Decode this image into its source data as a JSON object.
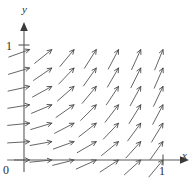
{
  "figure": {
    "axes": {
      "x_axis_label": "x",
      "y_axis_label": "y",
      "origin_label": "0",
      "x_tick_label": "1",
      "y_tick_label": "1"
    }
  },
  "chart_data": {
    "type": "scatter",
    "plot_kind": "direction-field",
    "title": "",
    "subtitle": "",
    "xlabel": "x",
    "ylabel": "y",
    "xlim": [
      0,
      1.18
    ],
    "ylim": [
      0,
      1.12
    ],
    "xticks": [
      0,
      1
    ],
    "xticklabels": [
      "0",
      "1"
    ],
    "yticks": [
      0,
      1
    ],
    "yticklabels": [
      "0",
      "1"
    ],
    "grid": false,
    "legend": null,
    "annotations": [],
    "grid_nx": 7,
    "grid_ny": 7,
    "x": [
      0.04,
      0.2,
      0.36,
      0.52,
      0.68,
      0.84,
      1.0
    ],
    "y": [
      0.0,
      0.16,
      0.32,
      0.48,
      0.64,
      0.8,
      0.96
    ],
    "slopes": [
      [
        0.0,
        0.1,
        0.25,
        0.45,
        0.65,
        0.9,
        1.2
      ],
      [
        0.06,
        0.18,
        0.36,
        0.58,
        0.82,
        1.1,
        1.4
      ],
      [
        0.1,
        0.3,
        0.52,
        0.78,
        1.05,
        1.35,
        1.65
      ],
      [
        0.16,
        0.42,
        0.7,
        1.0,
        1.3,
        1.6,
        1.9
      ],
      [
        0.22,
        0.55,
        0.88,
        1.2,
        1.52,
        1.82,
        2.1
      ],
      [
        0.3,
        0.68,
        1.05,
        1.4,
        1.72,
        2.0,
        2.3
      ],
      [
        0.36,
        0.8,
        1.2,
        1.58,
        1.9,
        2.18,
        2.45
      ]
    ],
    "arrow_length_px": 22,
    "arrowhead_position": "tip-at-gridpoint",
    "stroke_color": "#4a4a4a",
    "axis_color": "#5a5a5a"
  },
  "layout": {
    "origin_px": {
      "x": 24,
      "y": 160
    },
    "x_unit_px": 139,
    "y_unit_px": 115,
    "x_axis_end_px": 189,
    "y_axis_end_px": 22
  }
}
